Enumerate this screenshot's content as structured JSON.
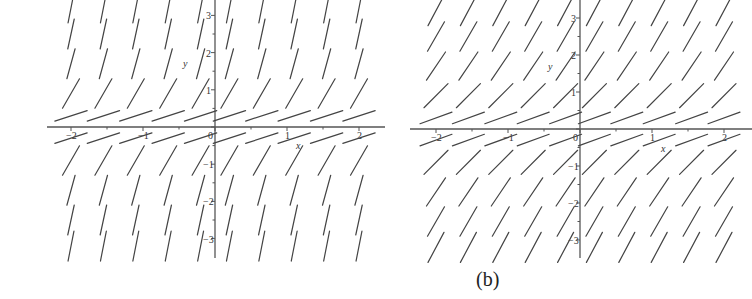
{
  "figure": {
    "caption": "(b)",
    "panels": [
      {
        "id": "left",
        "type": "slope-field",
        "x_label": "x",
        "y_label": "y",
        "x_ticks": [
          "−2",
          "−1",
          "0",
          "1",
          "2"
        ],
        "y_ticks": [
          "3",
          "2",
          "1",
          "−1",
          "−2",
          "−3"
        ],
        "x_range": [
          -2.2,
          2.2
        ],
        "y_range": [
          -3.4,
          3.4
        ],
        "grid_columns": 10,
        "grid_rows": 10,
        "description": "Slope depends only on y; segments nearly vertical for |y|>1.5, shallow near y=0"
      },
      {
        "id": "right",
        "type": "slope-field",
        "x_label": "x",
        "y_label": "y",
        "x_ticks": [
          "−2",
          "−1",
          "0",
          "1",
          "2"
        ],
        "y_ticks": [
          "3",
          "2",
          "1",
          "−1",
          "−2",
          "−3"
        ],
        "x_range": [
          -2.2,
          2.2
        ],
        "y_range": [
          -3.4,
          3.4
        ],
        "grid_columns": 10,
        "grid_rows": 10,
        "description": "Slope depends only on y; moderately steep for |y|>1, shallow near y=0"
      }
    ]
  },
  "chart_data": [
    {
      "type": "slope-field",
      "title": "",
      "xlabel": "x",
      "ylabel": "y",
      "xlim": [
        -2.2,
        2.2
      ],
      "ylim": [
        -3.4,
        3.4
      ],
      "x_ticks": [
        -2,
        -1,
        0,
        1,
        2
      ],
      "y_ticks": [
        -3,
        -2,
        -1,
        1,
        2,
        3
      ],
      "grid_x": [
        -2,
        -1.55,
        -1.1,
        -0.65,
        -0.2,
        0.2,
        0.65,
        1.1,
        1.55,
        2
      ],
      "grid_y": [
        3.2,
        2.5,
        1.7,
        0.9,
        0.3,
        -0.3,
        -0.9,
        -1.7,
        -2.5,
        -3.2
      ],
      "slope_angle_deg_by_row": [
        80,
        79,
        76,
        60,
        18,
        18,
        60,
        76,
        79,
        80
      ]
    },
    {
      "type": "slope-field",
      "title": "",
      "xlabel": "x",
      "ylabel": "y",
      "xlim": [
        -2.2,
        2.2
      ],
      "ylim": [
        -3.4,
        3.4
      ],
      "x_ticks": [
        -2,
        -1,
        0,
        1,
        2
      ],
      "y_ticks": [
        -3,
        -2,
        -1,
        1,
        2,
        3
      ],
      "grid_x": [
        -2,
        -1.55,
        -1.1,
        -0.65,
        -0.2,
        0.2,
        0.65,
        1.1,
        1.55,
        2
      ],
      "grid_y": [
        3.2,
        2.5,
        1.7,
        0.9,
        0.3,
        -0.3,
        -0.9,
        -1.7,
        -2.5,
        -3.2
      ],
      "slope_angle_deg_by_row": [
        62,
        60,
        56,
        45,
        20,
        20,
        45,
        56,
        60,
        62
      ]
    }
  ]
}
